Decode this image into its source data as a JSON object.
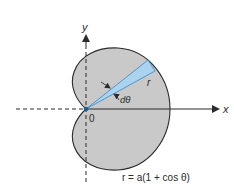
{
  "figure": {
    "type": "cardioid-polar-area-diagram",
    "equation": "r = a(1 + cos θ)",
    "axes": {
      "x_label": "x",
      "y_label": "y",
      "origin_label": "0"
    },
    "annotations": {
      "radius_label": "r",
      "angle_label": "dθ"
    },
    "colors": {
      "cardioid_fill": "#c9c9c9",
      "cardioid_stroke": "#2b2b2b",
      "wedge_fill": "#a9d3ef",
      "wedge_stroke": "#3a86c4",
      "axis": "#2b2b2b",
      "origin_dot": "#1f5f8f"
    }
  }
}
